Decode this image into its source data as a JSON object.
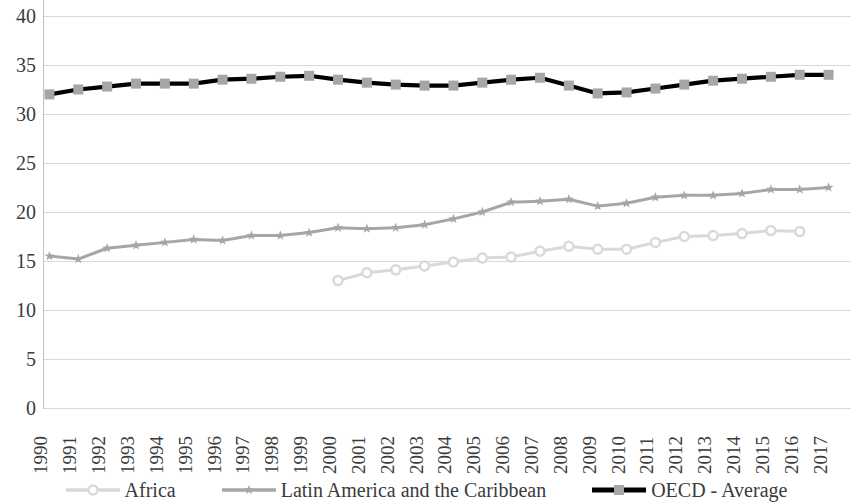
{
  "chart_data": {
    "type": "line",
    "title": "",
    "xlabel": "",
    "ylabel": "",
    "ylim": [
      0,
      40
    ],
    "ytick_step": 5,
    "grid": true,
    "legend_position": "bottom",
    "x": [
      1990,
      1991,
      1992,
      1993,
      1994,
      1995,
      1996,
      1997,
      1998,
      1999,
      2000,
      2001,
      2002,
      2003,
      2004,
      2005,
      2006,
      2007,
      2008,
      2009,
      2010,
      2011,
      2012,
      2013,
      2014,
      2015,
      2016,
      2017
    ],
    "yticks": [
      0,
      5,
      10,
      15,
      20,
      25,
      30,
      35,
      40
    ],
    "series": [
      {
        "name": "Africa",
        "color": "#d9d9d9",
        "marker": "circle",
        "values": [
          null,
          null,
          null,
          null,
          null,
          null,
          null,
          null,
          null,
          null,
          13.0,
          13.8,
          14.1,
          14.5,
          14.9,
          15.3,
          15.4,
          16.0,
          16.5,
          16.2,
          16.2,
          16.9,
          17.5,
          17.6,
          17.8,
          18.1,
          18.0,
          null
        ]
      },
      {
        "name": "Latin America and the Caribbean",
        "color": "#a6a6a6",
        "marker": "star",
        "values": [
          15.5,
          15.2,
          16.3,
          16.6,
          16.9,
          17.2,
          17.1,
          17.6,
          17.6,
          17.9,
          18.4,
          18.3,
          18.4,
          18.7,
          19.3,
          20.0,
          21.0,
          21.1,
          21.3,
          20.6,
          20.9,
          21.5,
          21.7,
          21.7,
          21.9,
          22.3,
          22.3,
          22.5
        ]
      },
      {
        "name": "OECD - Average",
        "color": "#000000",
        "marker": "square",
        "values": [
          32.0,
          32.5,
          32.8,
          33.1,
          33.1,
          33.1,
          33.5,
          33.6,
          33.8,
          33.9,
          33.5,
          33.2,
          33.0,
          32.9,
          32.9,
          33.2,
          33.5,
          33.7,
          32.9,
          32.1,
          32.2,
          32.6,
          33.0,
          33.4,
          33.6,
          33.8,
          34.0,
          34.0
        ]
      }
    ]
  }
}
